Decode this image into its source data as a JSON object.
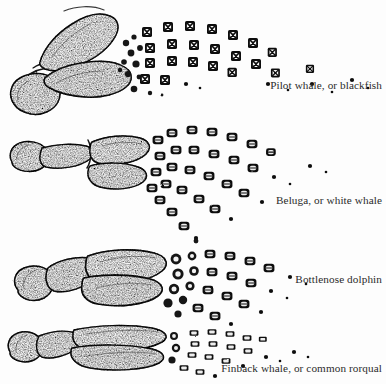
{
  "plate": {
    "title": "Comparative flipper skeletons of cetaceans",
    "background_color": "#fdfdfd",
    "ink_color": "#1a1a1a",
    "style": "stippled engraving"
  },
  "specimens": [
    {
      "id": "pilot-whale",
      "caption": "Pilot whale, or blackfish",
      "digit_count": 5,
      "phalanx_shape": "square",
      "fan_spread": "wide, strongly curved upward"
    },
    {
      "id": "beluga",
      "caption": "Beluga, or white whale",
      "digit_count": 5,
      "phalanx_shape": "rounded-blocky",
      "fan_spread": "broad, splayed downward and outward"
    },
    {
      "id": "bottlenose-dolphin",
      "caption": "Bottlenose dolphin",
      "digit_count": 5,
      "phalanx_shape": "blocky",
      "fan_spread": "compact, short rays"
    },
    {
      "id": "finback-whale",
      "caption": "Finback whale, or common rorqual",
      "digit_count": 4,
      "phalanx_shape": "small rectangular",
      "fan_spread": "narrow, nearly horizontal"
    }
  ]
}
